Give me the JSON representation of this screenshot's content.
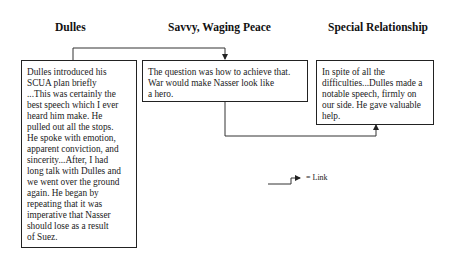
{
  "columns": [
    {
      "id": "dulles",
      "heading": "Dulles",
      "text": "Dulles introduced his\nSCUA plan briefly\n...This was certainly the\nbest speech which I ever\nheard him make. He\npulled out all the stops.\nHe spoke with emotion,\napparent conviction, and\nsincerity...After, I had\nlong talk with Dulles and\nwe went over the ground\nagain. He began by\nrepeating that it was\nimperative that Nasser\nshould lose as a result\nof Suez."
    },
    {
      "id": "savvy",
      "heading": "Savvy, Waging Peace",
      "text": "The question was how to achieve that.\nWar would make Nasser look like\na hero."
    },
    {
      "id": "special",
      "heading": "Special Relationship",
      "text": "In spite of all the\ndifficulties...Dulles made a\nnotable speech, firmly on\nour side. He gave valuable\nhelp."
    }
  ],
  "links": [
    {
      "from": "dulles",
      "to": "savvy"
    },
    {
      "from": "savvy",
      "to": "special"
    }
  ],
  "legend": {
    "icon": "link-arrow-icon",
    "label": "= Link"
  },
  "colors": {
    "line": "#222222",
    "background": "#ffffff"
  }
}
